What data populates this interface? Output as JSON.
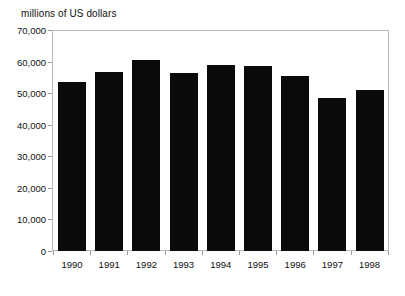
{
  "chart_data": {
    "type": "bar",
    "title": "",
    "subtitle": "",
    "ylabel": "millions of US dollars",
    "xlabel": "",
    "categories": [
      "1990",
      "1991",
      "1992",
      "1993",
      "1994",
      "1995",
      "1996",
      "1997",
      "1998"
    ],
    "values": [
      53500,
      56700,
      60400,
      56400,
      59000,
      58700,
      55400,
      48400,
      50900
    ],
    "series": [
      {
        "name": "value",
        "values": [
          53500,
          56700,
          60400,
          56400,
          59000,
          58700,
          55400,
          48400,
          50900
        ]
      }
    ],
    "ylim": [
      0,
      70000
    ],
    "ytick_values": [
      0,
      10000,
      20000,
      30000,
      40000,
      50000,
      60000,
      70000
    ],
    "ytick_labels": [
      "0",
      "10,000",
      "20,000",
      "30,000",
      "40,000",
      "50,000",
      "60,000",
      "70,000"
    ],
    "grid": false,
    "legend": false,
    "legend_position": "none",
    "bar_color": "#0a0a0a",
    "frame_color": "#b9b9b9",
    "background_color": "#ffffff"
  }
}
